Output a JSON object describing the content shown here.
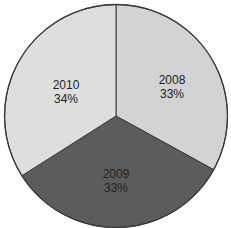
{
  "chart_data": {
    "type": "pie",
    "title": "",
    "categories": [
      "2008",
      "2009",
      "2010"
    ],
    "values": [
      33,
      33,
      34
    ],
    "labels": [
      "2008\n33%",
      "2009\n33%",
      "2010\n34%"
    ],
    "start_angle_deg": 90,
    "direction": "clockwise",
    "legend": "none (labels inside slices)",
    "slices": [
      {
        "name": "2008",
        "percent": "33%",
        "color": "#d3d3d3"
      },
      {
        "name": "2009",
        "percent": "33%",
        "color": "#5c5c5c"
      },
      {
        "name": "2010",
        "percent": "34%",
        "color": "#dedede"
      }
    ]
  },
  "labels": {
    "s2008": {
      "year": "2008",
      "pct": "33%"
    },
    "s2009": {
      "year": "2009",
      "pct": "33%"
    },
    "s2010": {
      "year": "2010",
      "pct": "34%"
    }
  }
}
